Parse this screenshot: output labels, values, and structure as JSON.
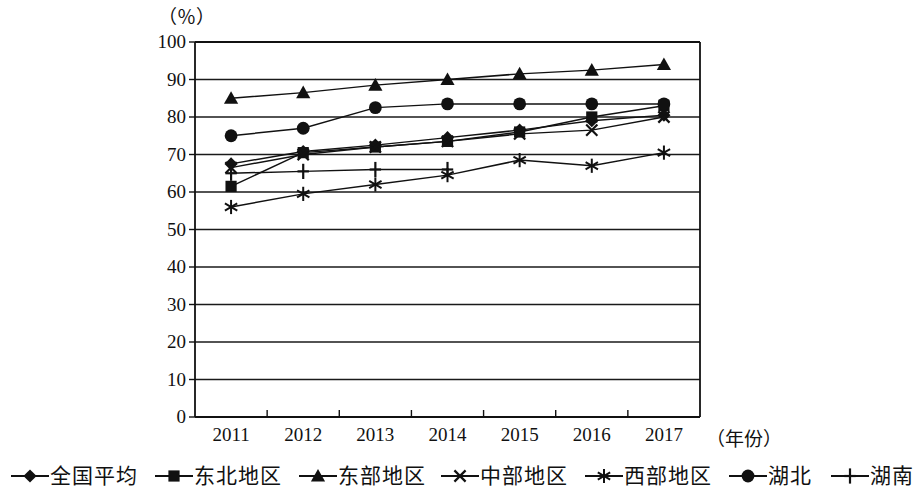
{
  "chart_data": {
    "type": "line",
    "title": "",
    "subtitle": "",
    "unit_label": "（％）",
    "ylabel": "",
    "xlabel": "（年份）",
    "categories": [
      "2011",
      "2012",
      "2013",
      "2014",
      "2015",
      "2016",
      "2017"
    ],
    "ylim": [
      0,
      100
    ],
    "ytick_labels": [
      "0",
      "10",
      "20",
      "30",
      "40",
      "50",
      "60",
      "70",
      "80",
      "90",
      "100"
    ],
    "ytick_values": [
      0,
      10,
      20,
      30,
      40,
      50,
      60,
      70,
      80,
      90,
      100
    ],
    "grid": "horizontal",
    "legend_position": "bottom",
    "series": [
      {
        "name": "全国平均",
        "marker": "diamond",
        "values": [
          67.5,
          70.8,
          72.5,
          74.5,
          76.5,
          79.0,
          80.5
        ]
      },
      {
        "name": "东北地区",
        "marker": "square",
        "values": [
          61.5,
          70.5,
          72.0,
          73.5,
          76.0,
          80.0,
          83.0
        ]
      },
      {
        "name": "东部地区",
        "marker": "triangle",
        "values": [
          85.0,
          86.5,
          88.5,
          90.0,
          91.5,
          92.5,
          94.0
        ]
      },
      {
        "name": "中部地区",
        "marker": "cross",
        "values": [
          66.5,
          70.0,
          72.0,
          73.5,
          75.5,
          76.5,
          80.0
        ]
      },
      {
        "name": "西部地区",
        "marker": "asterisk",
        "values": [
          56.0,
          59.5,
          62.0,
          64.5,
          68.5,
          67.0,
          70.5
        ]
      },
      {
        "name": "湖北",
        "marker": "circle",
        "values": [
          75.0,
          77.0,
          82.5,
          83.5,
          83.5,
          83.5,
          83.5
        ]
      },
      {
        "name": "湖南",
        "marker": "plus",
        "values": [
          65.0,
          65.5,
          66.0,
          66.0,
          0,
          0,
          0
        ]
      }
    ]
  },
  "legend": {
    "items": [
      {
        "label": "全国平均",
        "marker": "diamond"
      },
      {
        "label": "东北地区",
        "marker": "square"
      },
      {
        "label": "东部地区",
        "marker": "triangle"
      },
      {
        "label": "中部地区",
        "marker": "cross"
      },
      {
        "label": "西部地区",
        "marker": "asterisk"
      },
      {
        "label": "湖北",
        "marker": "circle"
      },
      {
        "label": "湖南",
        "marker": "plus"
      }
    ]
  },
  "colors": {
    "ink": "#111111",
    "background": "#ffffff",
    "grid": "#1a1a1a"
  }
}
